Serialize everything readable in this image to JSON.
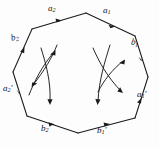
{
  "figure": {
    "kind": "octagon-fundamental-polygon",
    "stroke_color": "#1a1a1a",
    "background_color": "#fdfdfd"
  },
  "labels": {
    "a2": {
      "base": "a",
      "sub": "2",
      "prime": "",
      "text": "a2"
    },
    "a1": {
      "base": "a",
      "sub": "1",
      "prime": "",
      "text": "a1"
    },
    "b2": {
      "base": "b",
      "sub": "2",
      "prime": "",
      "text": "b2"
    },
    "b1": {
      "base": "b",
      "sub": "1",
      "prime": "",
      "text": "b1"
    },
    "a2p": {
      "base": "a",
      "sub": "2",
      "prime": "′",
      "text": "a2'"
    },
    "a1p": {
      "base": "a",
      "sub": "1",
      "prime": "′",
      "text": "a1'"
    },
    "b2p": {
      "base": "b",
      "sub": "2",
      "prime": "′",
      "text": "b2'"
    },
    "b1p": {
      "base": "b",
      "sub": "1",
      "prime": "′",
      "text": "b1'"
    }
  },
  "edges": [
    {
      "id": "a2",
      "label_key": "a2",
      "position": "top-left",
      "direction": "right"
    },
    {
      "id": "a1",
      "label_key": "a1",
      "position": "top-right",
      "direction": "down-right"
    },
    {
      "id": "b2",
      "label_key": "b2",
      "position": "upper-left",
      "direction": "up-right"
    },
    {
      "id": "b1",
      "label_key": "b1",
      "position": "upper-right",
      "direction": "down-right"
    },
    {
      "id": "a2p",
      "label_key": "a2p",
      "position": "lower-left",
      "direction": "down-right"
    },
    {
      "id": "a1p",
      "label_key": "a1p",
      "position": "lower-right",
      "direction": "up-right"
    },
    {
      "id": "b2p",
      "label_key": "b2p",
      "position": "bottom-left",
      "direction": "right"
    },
    {
      "id": "b1p",
      "label_key": "b1p",
      "position": "bottom-right",
      "direction": "right"
    }
  ],
  "interior_arrows": [
    {
      "id": "left-up",
      "side": "left",
      "from": "lower-left",
      "to": "upper-right",
      "head": "up-right"
    },
    {
      "id": "left-down",
      "side": "left",
      "from": "upper-right",
      "to": "lower-left",
      "head": "down-left"
    },
    {
      "id": "left-drop",
      "side": "left",
      "from": "upper",
      "to": "lower",
      "head": "down"
    },
    {
      "id": "right-up",
      "side": "right",
      "from": "lower-left",
      "to": "upper-right",
      "head": "up-right"
    },
    {
      "id": "right-down",
      "side": "right",
      "from": "upper-left",
      "to": "lower-right",
      "head": "down-right"
    },
    {
      "id": "right-drop",
      "side": "right",
      "from": "upper",
      "to": "lower",
      "head": "down"
    }
  ]
}
